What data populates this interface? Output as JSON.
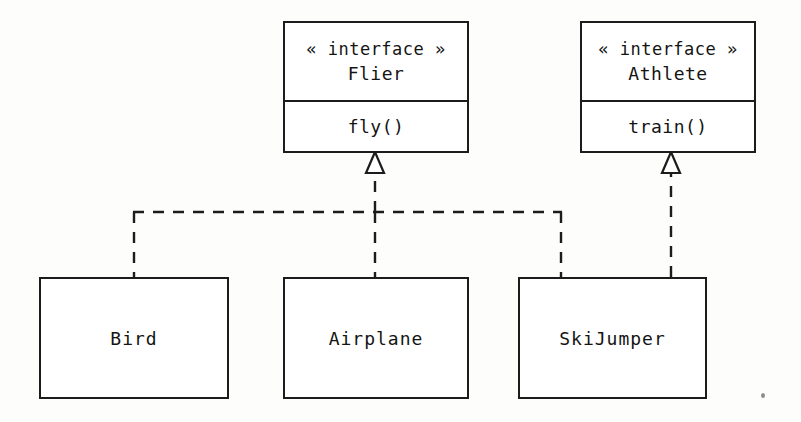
{
  "diagram": {
    "type": "uml-class-diagram",
    "background_color": "#fdfdfb",
    "line_color": "#1c1c1c",
    "text_color": "#141414"
  },
  "interfaces": [
    {
      "id": "flier",
      "stereotype": "« interface »",
      "name": "Flier",
      "operation": "fly()"
    },
    {
      "id": "athlete",
      "stereotype": "« interface »",
      "name": "Athlete",
      "operation": "train()"
    }
  ],
  "classes": [
    {
      "id": "bird",
      "name": "Bird"
    },
    {
      "id": "airplane",
      "name": "Airplane"
    },
    {
      "id": "skijumper",
      "name": "SkiJumper"
    }
  ],
  "relationships": [
    {
      "type": "realization",
      "from": "Bird",
      "to": "Flier",
      "line_style": "dashed",
      "arrowhead": "hollow-triangle"
    },
    {
      "type": "realization",
      "from": "Airplane",
      "to": "Flier",
      "line_style": "dashed",
      "arrowhead": "hollow-triangle"
    },
    {
      "type": "realization",
      "from": "SkiJumper",
      "to": "Flier",
      "line_style": "dashed",
      "arrowhead": "hollow-triangle"
    },
    {
      "type": "realization",
      "from": "SkiJumper",
      "to": "Athlete",
      "line_style": "dashed",
      "arrowhead": "hollow-triangle"
    }
  ]
}
